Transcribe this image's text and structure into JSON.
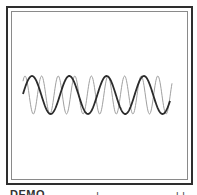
{
  "figure": {
    "colors": {
      "outer_border": "#2e2e2e",
      "inner_border": "#8a8a8a",
      "dark_wave": "#2b2b2b",
      "light_wave": "#a0a0a0",
      "background": "#ffffff"
    },
    "waves": [
      {
        "name": "dark-wave",
        "x_start": 23,
        "x_end": 170,
        "center_y": 95,
        "amplitude": 19,
        "period_px": 37.3,
        "peak_x": [
          32,
          69,
          106,
          143
        ],
        "trough_x": [
          50,
          87,
          125,
          162
        ],
        "stroke_width": 1.8
      },
      {
        "name": "light-wave",
        "x_start": 23,
        "x_end": 172,
        "center_y": 95,
        "amplitude": 19,
        "period_px": 16.6,
        "peak_x": [
          25,
          41,
          58,
          75,
          92,
          108,
          125,
          141,
          158
        ],
        "trough_x": [
          34,
          50,
          67,
          83,
          100,
          117,
          133,
          150,
          167
        ],
        "stroke_width": 1
      }
    ]
  },
  "caption": {
    "left": "DEMO",
    "mid": "ı",
    "right": "ı ı"
  }
}
